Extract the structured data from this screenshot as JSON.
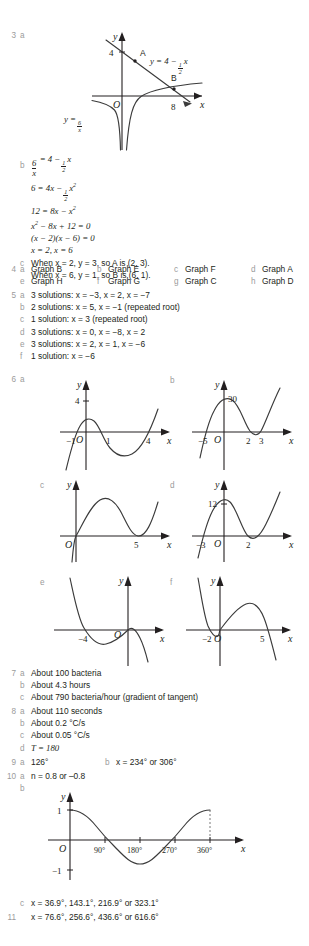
{
  "page": {
    "width": 309,
    "height": 946,
    "background": "#ffffff",
    "text_color": "#231f20",
    "label_color": "#9b9b9b"
  },
  "q3": {
    "number": "3",
    "part_a": "a",
    "graph": {
      "axis_y": "y",
      "axis_x": "x",
      "origin": "O",
      "y_intercept": "4",
      "x_intercept": "8",
      "point_a": "A",
      "point_b": "B",
      "line_equation_prefix": "y = 4 −",
      "line_equation_frac_num": "1",
      "line_equation_frac_den": "2",
      "line_equation_suffix": "x",
      "hyperbola_prefix": "y =",
      "hyperbola_num": "6",
      "hyperbola_den": "x"
    },
    "part_b": "b",
    "work": [
      {
        "left_num": "6",
        "left_den": "x",
        "rest_prefix": "= 4 −",
        "frac_n": "1",
        "frac_d": "2",
        "rest_suffix": "x"
      },
      {
        "text": "6 = 4x −",
        "frac_n": "1",
        "frac_d": "2",
        "suffix": "x",
        "exp": "2"
      },
      {
        "text": "12 = 8x − x",
        "exp": "2"
      },
      {
        "text": "x",
        "exp": "2",
        "after": " − 8x + 12 = 0"
      },
      {
        "text": "(x − 2)(x − 6) = 0"
      },
      {
        "text": "x = 2, x = 6"
      }
    ],
    "part_c": "c",
    "c_lines": [
      "When x = 2, y = 3, so A is (2, 3).",
      "When x = 6, y = 1, so B is (6, 1)."
    ]
  },
  "q4": {
    "number": "4",
    "answers": [
      {
        "letter": "a",
        "text": "Graph B"
      },
      {
        "letter": "b",
        "text": "Graph E"
      },
      {
        "letter": "c",
        "text": "Graph F"
      },
      {
        "letter": "d",
        "text": "Graph A"
      },
      {
        "letter": "e",
        "text": "Graph H"
      },
      {
        "letter": "f",
        "text": "Graph G"
      },
      {
        "letter": "g",
        "text": "Graph C"
      },
      {
        "letter": "h",
        "text": "Graph D"
      }
    ]
  },
  "q5": {
    "number": "5",
    "answers": [
      {
        "letter": "a",
        "text": "3 solutions: x = −3, x = 2, x = −7"
      },
      {
        "letter": "b",
        "text": "2 solutions: x = 5, x = −1 (repeated root)"
      },
      {
        "letter": "c",
        "text": "1 solution: x = 3 (repeated root)"
      },
      {
        "letter": "d",
        "text": "3 solutions: x = 0, x = −8, x = 2"
      },
      {
        "letter": "e",
        "text": "3 solutions: x = 2, x = 1, x = −6"
      },
      {
        "letter": "f",
        "text": "1 solution: x = −6"
      }
    ]
  },
  "q6": {
    "number": "6",
    "graphs": [
      {
        "letter": "a",
        "type": "cubic",
        "axis_y": "y",
        "axis_x": "x",
        "origin": "O",
        "y_label": "4",
        "x_labels": [
          "−1",
          "1",
          "4"
        ],
        "roots": [
          -1,
          1,
          4
        ],
        "y_intercept": 4
      },
      {
        "letter": "b",
        "type": "cubic",
        "axis_y": "y",
        "axis_x": "x",
        "origin": "O",
        "y_label": "30",
        "x_labels": [
          "−5",
          "2",
          "3"
        ],
        "roots": [
          -5,
          2,
          3
        ],
        "y_intercept": 30
      },
      {
        "letter": "c",
        "type": "cubic",
        "axis_y": "y",
        "axis_x": "x",
        "origin": "O",
        "y_label": "",
        "x_labels": [
          "5"
        ],
        "roots": [
          0,
          5,
          5
        ],
        "y_intercept": 0
      },
      {
        "letter": "d",
        "type": "cubic",
        "axis_y": "y",
        "axis_x": "x",
        "origin": "O",
        "y_label": "12",
        "x_labels": [
          "−3",
          "2"
        ],
        "roots": [
          -3,
          2,
          2
        ],
        "y_intercept": 12
      },
      {
        "letter": "e",
        "type": "cubic-negative",
        "axis_y": "y",
        "axis_x": "x",
        "origin": "O",
        "y_label": "",
        "x_labels": [
          "−4"
        ],
        "roots": [
          -4,
          0,
          0
        ],
        "y_intercept": 0
      },
      {
        "letter": "f",
        "type": "cubic-negative",
        "axis_y": "y",
        "axis_x": "x",
        "origin": "O",
        "y_label": "",
        "x_labels": [
          "−2",
          "5"
        ],
        "roots": [
          -2,
          0,
          5
        ],
        "y_intercept": 0
      }
    ]
  },
  "q7": {
    "number": "7",
    "answers": [
      {
        "letter": "a",
        "text": "About 100 bacteria"
      },
      {
        "letter": "b",
        "text": "About 4.3 hours"
      },
      {
        "letter": "c",
        "text": "About 790 bacteria/hour (gradient of tangent)"
      }
    ]
  },
  "q8": {
    "number": "8",
    "answers": [
      {
        "letter": "a",
        "text": "About 110 seconds"
      },
      {
        "letter": "b",
        "text": "About 0.2 °C/s"
      },
      {
        "letter": "c",
        "text": "About 0.05 °C/s"
      },
      {
        "letter": "d",
        "text": "T = 180"
      }
    ]
  },
  "q9": {
    "number": "9",
    "answers": [
      {
        "letter": "a",
        "text": "126°"
      },
      {
        "letter": "b",
        "text": "x = 234° or 306°"
      }
    ]
  },
  "q10": {
    "number": "10",
    "part_a_letter": "a",
    "part_a_text": "n = 0.8 or –0.8",
    "part_b_letter": "b",
    "graph": {
      "type": "cosine",
      "axis_y": "y",
      "axis_x": "x",
      "origin": "O",
      "y_labels": [
        "1",
        "−1"
      ],
      "x_labels": [
        "90°",
        "180°",
        "270°",
        "360°"
      ],
      "x_ticks": [
        90,
        180,
        270,
        360
      ],
      "ylim": [
        -1,
        1
      ],
      "xlim": [
        0,
        360
      ]
    },
    "part_c_letter": "c",
    "part_c_text": "x = 36.9°, 143.1°, 216.9° or 323.1°"
  },
  "q11": {
    "number": "11",
    "text": "x = 76.6°, 256.6°, 436.6° or 616.6°"
  }
}
